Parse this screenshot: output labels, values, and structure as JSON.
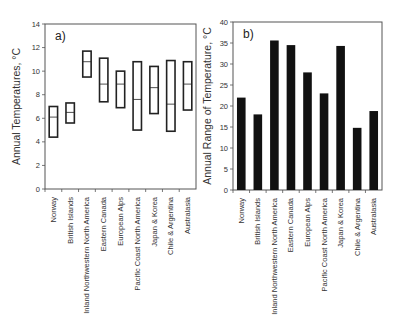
{
  "chart_data": [
    {
      "type": "boxplot",
      "panel_label": "a)",
      "title": "",
      "xlabel": "",
      "ylabel": "Annual Temperatures, °C",
      "ylim": [
        0,
        14
      ],
      "yticks": [
        0,
        2,
        4,
        6,
        8,
        10,
        12,
        14
      ],
      "grid": false,
      "categories": [
        "Norway",
        "British Islands",
        "Inland Northwestern North America",
        "Eastern Canada",
        "European Alps",
        "Pacific Coast North America",
        "Japan & Korea",
        "Chile & Argentina",
        "Australasia"
      ],
      "series": [
        {
          "name": "max",
          "values": [
            7.0,
            7.3,
            11.7,
            11.1,
            10.0,
            10.8,
            10.4,
            10.9,
            10.8
          ]
        },
        {
          "name": "mean",
          "values": [
            6.1,
            6.5,
            10.8,
            8.9,
            8.9,
            7.6,
            8.6,
            7.2,
            8.9
          ]
        },
        {
          "name": "min",
          "values": [
            4.4,
            5.6,
            9.5,
            7.4,
            6.9,
            5.0,
            6.4,
            4.9,
            6.7
          ]
        }
      ]
    },
    {
      "type": "bar",
      "panel_label": "b)",
      "title": "",
      "xlabel": "",
      "ylabel": "Annual Range of Temperature, °C",
      "ylim": [
        0,
        40
      ],
      "yticks": [
        0,
        5,
        10,
        15,
        20,
        25,
        30,
        35,
        40
      ],
      "grid": false,
      "categories": [
        "Norway",
        "British Islands",
        "Inland Northwestern North America",
        "Eastern Canada",
        "European Alps",
        "Pacific Coast North America",
        "Japan & Korea",
        "Chile & Argentina",
        "Australasia"
      ],
      "values": [
        22,
        18,
        35.6,
        34.5,
        28,
        23,
        34.3,
        14.8,
        18.8
      ]
    }
  ]
}
